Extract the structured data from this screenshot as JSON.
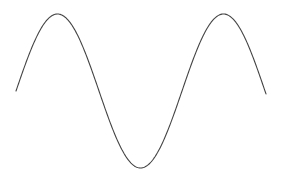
{
  "chart_data": {
    "type": "line",
    "title": "",
    "xlabel": "",
    "ylabel": "",
    "grid": false,
    "legend": null,
    "series": [
      {
        "name": "sine wave",
        "function": "sin",
        "periods": 1.5,
        "phase_start": 0,
        "x": [
          0,
          0.25,
          0.5,
          0.75,
          1.0,
          1.25,
          1.5
        ],
        "values": [
          0,
          1,
          0,
          -1,
          0,
          1,
          0
        ],
        "color": "#444444"
      }
    ],
    "pixel_geometry": {
      "x_start": 16,
      "x_end": 266,
      "midline_y": 91,
      "amplitude_px": 77,
      "wavelength_px": 166
    },
    "ylim": [
      -1,
      1
    ]
  }
}
